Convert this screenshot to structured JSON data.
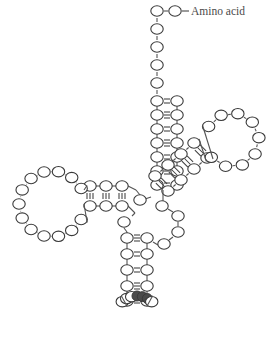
{
  "diagram": {
    "background_color": "#ffffff",
    "nucleotide_outline_color": "#3a3a3a",
    "nucleotide_fill_color": "#ffffff",
    "anticodon_fill_color": "#4a4a4a",
    "backbone_color": "#545454",
    "bond_color": "#3f3f3f"
  },
  "labels": {
    "amino_acid": "Amino acid",
    "amino_acid_dash": "–"
  },
  "acceptor_arm": {
    "name": "acceptor-stem",
    "single_strand_3prime_count": 6,
    "base_pair_count": 7,
    "bond_orders": [
      2,
      3,
      2,
      3,
      2,
      3,
      2
    ],
    "single_strand_nodes": [
      {
        "x": 157,
        "y": 11
      },
      {
        "x": 175,
        "y": 11
      },
      {
        "x": 157,
        "y": 29
      },
      {
        "x": 157,
        "y": 47
      },
      {
        "x": 157,
        "y": 65
      },
      {
        "x": 157,
        "y": 83
      }
    ],
    "left_nodes": [
      {
        "x": 157,
        "y": 101
      },
      {
        "x": 157,
        "y": 115
      },
      {
        "x": 157,
        "y": 129
      },
      {
        "x": 157,
        "y": 143
      },
      {
        "x": 157,
        "y": 157
      },
      {
        "x": 157,
        "y": 171
      },
      {
        "x": 157,
        "y": 185
      }
    ],
    "right_nodes": [
      {
        "x": 177,
        "y": 101
      },
      {
        "x": 177,
        "y": 115
      },
      {
        "x": 177,
        "y": 129
      },
      {
        "x": 177,
        "y": 143
      },
      {
        "x": 177,
        "y": 157
      },
      {
        "x": 177,
        "y": 171
      },
      {
        "x": 177,
        "y": 185
      }
    ]
  },
  "d_arm": {
    "name": "d-arm",
    "base_pair_count": 3,
    "bond_orders": [
      3,
      3,
      3
    ],
    "top_nodes": [
      {
        "x": 90,
        "y": 186
      },
      {
        "x": 106,
        "y": 186
      },
      {
        "x": 122,
        "y": 186
      }
    ],
    "bottom_nodes": [
      {
        "x": 90,
        "y": 206
      },
      {
        "x": 106,
        "y": 206
      },
      {
        "x": 122,
        "y": 206
      }
    ],
    "loop": {
      "center_x": 52,
      "center_y": 204,
      "radius": 33,
      "node_count": 13,
      "start_angle_deg": 28,
      "end_angle_deg": 332
    }
  },
  "t_arm": {
    "name": "t-arm",
    "base_pair_count": 4,
    "bond_orders": [
      3,
      3,
      3,
      3
    ],
    "inner_nodes": [
      {
        "x": 168,
        "y": 191
      },
      {
        "x": 181,
        "y": 180
      },
      {
        "x": 194,
        "y": 169
      },
      {
        "x": 207,
        "y": 158
      }
    ],
    "outer_nodes": [
      {
        "x": 155,
        "y": 176
      },
      {
        "x": 168,
        "y": 165
      },
      {
        "x": 181,
        "y": 154
      },
      {
        "x": 194,
        "y": 143
      }
    ],
    "loop": {
      "center_x": 232,
      "center_y": 140,
      "radius": 27,
      "node_count": 9,
      "start_angle_deg": 140,
      "end_angle_deg": -150
    }
  },
  "anticodon_arm": {
    "name": "anticodon-arm",
    "base_pair_count": 5,
    "bond_orders": [
      3,
      2,
      2,
      3,
      2
    ],
    "left_nodes": [
      {
        "x": 127,
        "y": 238
      },
      {
        "x": 127,
        "y": 254
      },
      {
        "x": 127,
        "y": 270
      },
      {
        "x": 127,
        "y": 286
      },
      {
        "x": 127,
        "y": 301
      }
    ],
    "right_nodes": [
      {
        "x": 147,
        "y": 238
      },
      {
        "x": 147,
        "y": 254
      },
      {
        "x": 147,
        "y": 270
      },
      {
        "x": 147,
        "y": 286
      },
      {
        "x": 147,
        "y": 301
      }
    ],
    "loop": {
      "center_x": 137,
      "center_y": 318,
      "radius": 22,
      "node_count": 7,
      "start_angle_deg": -132,
      "end_angle_deg": -48
    },
    "anticodon_positions": [
      3,
      4,
      5
    ],
    "anticodon_node_count": 3
  },
  "junction": {
    "name": "junction-connectors",
    "nodes": [
      {
        "x": 140,
        "y": 200
      },
      {
        "x": 124,
        "y": 222
      },
      {
        "x": 162,
        "y": 207
      },
      {
        "x": 178,
        "y": 216
      },
      {
        "x": 177,
        "y": 232
      },
      {
        "x": 164,
        "y": 244
      }
    ]
  },
  "legend": {
    "open_circle_meaning": "nucleotide",
    "filled_circle_meaning": "anticodon nucleotide"
  }
}
